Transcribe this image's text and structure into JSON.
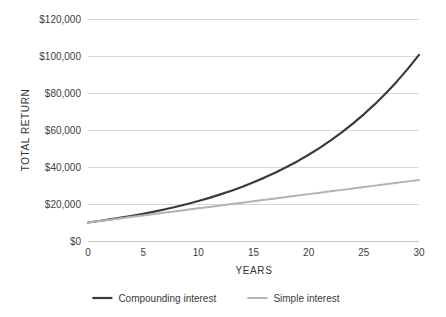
{
  "chart_data": {
    "type": "line",
    "title": "",
    "xlabel": "YEARS",
    "ylabel": "TOTAL RETURN",
    "xlim": [
      0,
      30
    ],
    "ylim": [
      0,
      120000
    ],
    "grid": true,
    "grid_axis": "y",
    "legend_position": "bottom",
    "x_ticks": [
      0,
      5,
      10,
      15,
      20,
      25,
      30
    ],
    "x_tick_labels": [
      "0",
      "5",
      "10",
      "15",
      "20",
      "25",
      "30"
    ],
    "y_ticks": [
      0,
      20000,
      40000,
      60000,
      80000,
      100000,
      120000
    ],
    "y_tick_labels": [
      "$0",
      "$20,000",
      "$40,000",
      "$60,000",
      "$80,000",
      "$100,000",
      "$120,000"
    ],
    "x": [
      0,
      1,
      2,
      3,
      4,
      5,
      6,
      7,
      8,
      9,
      10,
      11,
      12,
      13,
      14,
      15,
      16,
      17,
      18,
      19,
      20,
      21,
      22,
      23,
      24,
      25,
      26,
      27,
      28,
      29,
      30
    ],
    "series": [
      {
        "name": "Compounding interest",
        "color": "#3a3a3a",
        "width": 2.2,
        "values": [
          10000,
          10800,
          11664,
          12597,
          13605,
          14693,
          15869,
          17138,
          18509,
          19990,
          21589,
          23316,
          25182,
          27196,
          29372,
          31722,
          34259,
          37000,
          39960,
          43157,
          46610,
          50338,
          54365,
          58715,
          63412,
          68485,
          73964,
          79881,
          86271,
          93173,
          100627
        ]
      },
      {
        "name": "Simple interest",
        "color": "#b3b3b3",
        "width": 2.0,
        "values": [
          10000,
          10767,
          11533,
          12300,
          13067,
          13833,
          14600,
          15367,
          16133,
          16900,
          17667,
          18433,
          19200,
          19967,
          20733,
          21500,
          22267,
          23033,
          23800,
          24567,
          25333,
          26100,
          26867,
          27633,
          28400,
          29167,
          29933,
          30700,
          31467,
          32233,
          33000
        ]
      }
    ],
    "annotations": []
  },
  "legend": {
    "items": [
      {
        "label": "Compounding interest",
        "color": "#3a3a3a"
      },
      {
        "label": "Simple interest",
        "color": "#b3b3b3"
      }
    ]
  },
  "colors": {
    "background": "#ffffff",
    "gridline": "#d9d9d9",
    "axis": "#c8c8c8",
    "text": "#3a3a3a",
    "compounding": "#3a3a3a",
    "simple": "#b3b3b3"
  }
}
